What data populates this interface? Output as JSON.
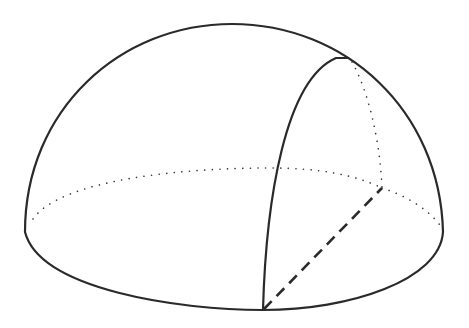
{
  "diagram": {
    "type": "geometric-solid",
    "canvas": {
      "width": 469,
      "height": 328,
      "background": "#ffffff"
    },
    "stroke_color": "#2a2a2a",
    "elements": [
      {
        "name": "dome-outline",
        "style": "solid"
      },
      {
        "name": "base-front-arc",
        "style": "solid"
      },
      {
        "name": "base-back-arc",
        "style": "dotted"
      },
      {
        "name": "meridian-arc",
        "style": "solid"
      },
      {
        "name": "vertical-radius",
        "style": "dotted"
      },
      {
        "name": "base-radius",
        "style": "dashed"
      },
      {
        "name": "base-back-right-segment",
        "style": "dotted"
      }
    ],
    "key_points": {
      "dome_top": [
        230,
        24
      ],
      "base_left": [
        25,
        228
      ],
      "base_right": [
        443,
        228
      ],
      "base_front": [
        263,
        310
      ],
      "meridian_top": [
        345,
        58
      ],
      "inner_point": [
        382,
        188
      ]
    },
    "labels": []
  }
}
